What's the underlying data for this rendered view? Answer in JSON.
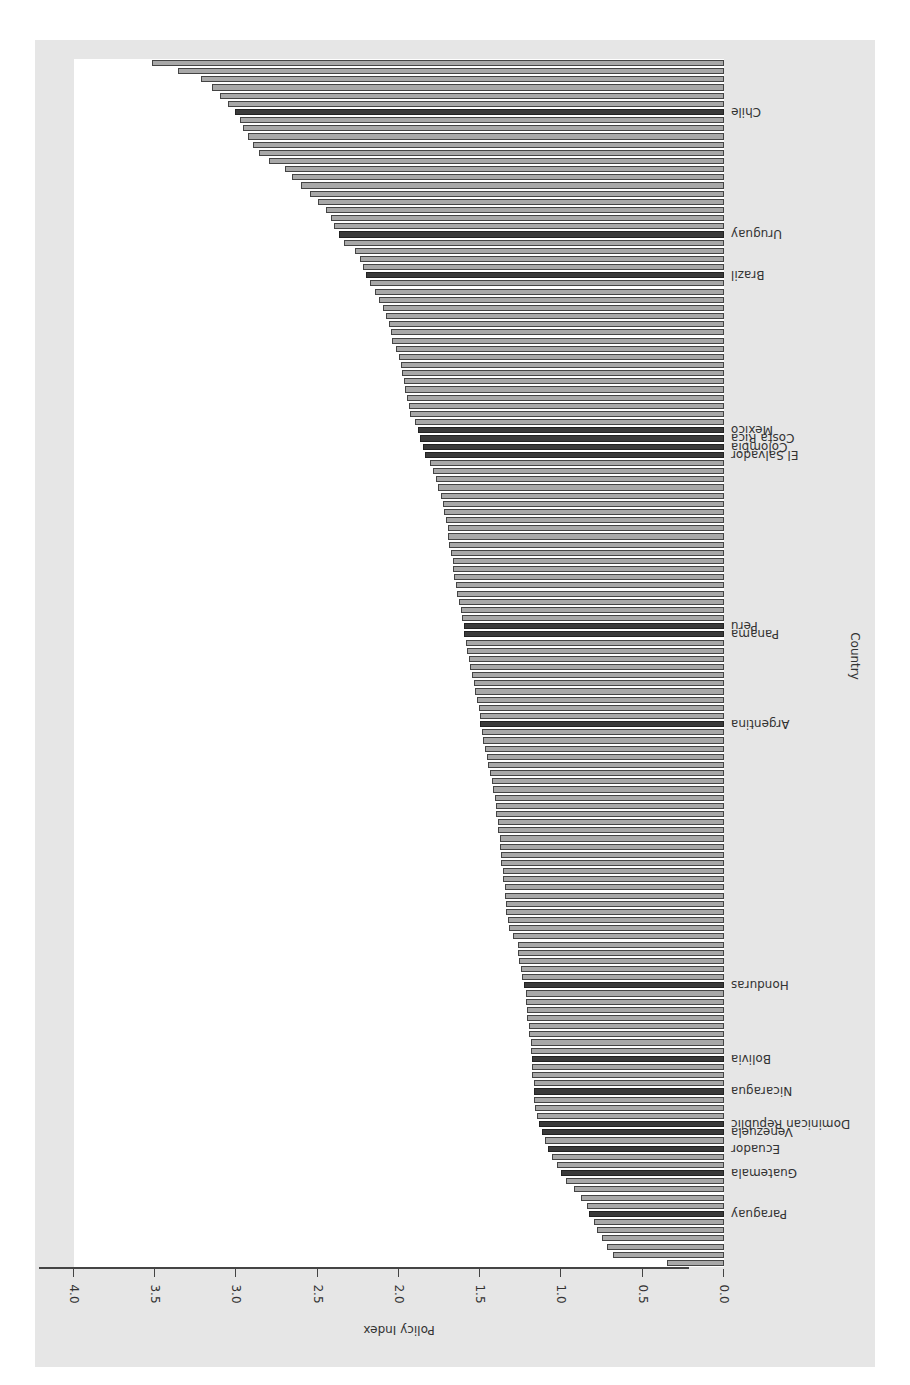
{
  "chart_data": {
    "type": "bar",
    "orientation": "horizontal",
    "rotation_degrees": 180,
    "title": "",
    "xlabel": "Policy Index",
    "ylabel": "Country",
    "xlim": [
      0.0,
      4.0
    ],
    "x_ticks": [
      "0.0",
      "0.5",
      "1.0",
      "1.5",
      "2.0",
      "2.5",
      "3.0",
      "3.5",
      "4.0"
    ],
    "grid": false,
    "legend": null,
    "n_bars": 146,
    "values_sorted_ascending": [
      0.35,
      0.68,
      0.72,
      0.75,
      0.78,
      0.8,
      0.83,
      0.84,
      0.88,
      0.92,
      0.97,
      1.0,
      1.03,
      1.06,
      1.08,
      1.1,
      1.12,
      1.14,
      1.15,
      1.16,
      1.17,
      1.17,
      1.17,
      1.18,
      1.18,
      1.18,
      1.19,
      1.19,
      1.2,
      1.2,
      1.21,
      1.21,
      1.22,
      1.22,
      1.23,
      1.24,
      1.25,
      1.26,
      1.27,
      1.27,
      1.3,
      1.32,
      1.33,
      1.34,
      1.34,
      1.35,
      1.35,
      1.36,
      1.36,
      1.37,
      1.37,
      1.38,
      1.38,
      1.39,
      1.39,
      1.4,
      1.4,
      1.41,
      1.42,
      1.43,
      1.44,
      1.45,
      1.46,
      1.47,
      1.48,
      1.49,
      1.5,
      1.5,
      1.51,
      1.52,
      1.53,
      1.54,
      1.55,
      1.56,
      1.57,
      1.58,
      1.59,
      1.6,
      1.6,
      1.61,
      1.62,
      1.63,
      1.64,
      1.65,
      1.66,
      1.67,
      1.67,
      1.68,
      1.69,
      1.7,
      1.7,
      1.71,
      1.72,
      1.73,
      1.74,
      1.76,
      1.77,
      1.79,
      1.81,
      1.84,
      1.85,
      1.87,
      1.88,
      1.9,
      1.93,
      1.94,
      1.95,
      1.96,
      1.97,
      1.98,
      1.99,
      2.0,
      2.02,
      2.04,
      2.05,
      2.06,
      2.08,
      2.1,
      2.12,
      2.15,
      2.18,
      2.2,
      2.22,
      2.24,
      2.27,
      2.34,
      2.37,
      2.4,
      2.42,
      2.45,
      2.5,
      2.55,
      2.6,
      2.66,
      2.7,
      2.8,
      2.86,
      2.9,
      2.93,
      2.96,
      2.98,
      3.01,
      3.05,
      3.1,
      3.15,
      3.22,
      3.36,
      3.52
    ],
    "highlighted": [
      {
        "country": "Paraguay",
        "index": 6,
        "value": 0.83
      },
      {
        "country": "Guatemala",
        "index": 11,
        "value": 1.0
      },
      {
        "country": "Ecuador",
        "index": 14,
        "value": 1.08
      },
      {
        "country": "Venezuela",
        "index": 16,
        "value": 1.12
      },
      {
        "country": "Dominican Republic",
        "index": 17,
        "value": 1.14
      },
      {
        "country": "Nicaragua",
        "index": 21,
        "value": 1.17
      },
      {
        "country": "Bolivia",
        "index": 25,
        "value": 1.18
      },
      {
        "country": "Honduras",
        "index": 34,
        "value": 1.23
      },
      {
        "country": "Argentina",
        "index": 66,
        "value": 1.5
      },
      {
        "country": "Panama",
        "index": 77,
        "value": 1.6
      },
      {
        "country": "Peru",
        "index": 78,
        "value": 1.6
      },
      {
        "country": "El Salvador",
        "index": 99,
        "value": 1.84
      },
      {
        "country": "Colombia",
        "index": 100,
        "value": 1.85
      },
      {
        "country": "Costa Rica",
        "index": 101,
        "value": 1.87
      },
      {
        "country": "Mexico",
        "index": 102,
        "value": 1.88
      },
      {
        "country": "Brazil",
        "index": 121,
        "value": 2.2
      },
      {
        "country": "Uruguay",
        "index": 126,
        "value": 2.34
      },
      {
        "country": "Chile",
        "index": 141,
        "value": 2.98
      }
    ],
    "colors": {
      "bar": "#a8a8a8",
      "highlight": "#3a3a3a",
      "edge": "#444444",
      "panel": "#e6e6e6"
    }
  },
  "axis": {
    "xlabel": "Policy Index",
    "ylabel": "Country",
    "ticks": [
      "0.0",
      "0.5",
      "1.0",
      "1.5",
      "2.0",
      "2.5",
      "3.0",
      "3.5",
      "4.0"
    ]
  },
  "caption": "Policy Index ..."
}
